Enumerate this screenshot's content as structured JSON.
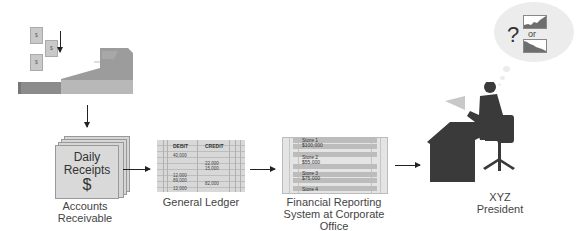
{
  "diagram": {
    "type": "flow",
    "nodes": [
      {
        "id": "cash-register",
        "label": ""
      },
      {
        "id": "accounts-receivable",
        "label_lines": [
          "Accounts",
          "Receivable"
        ]
      },
      {
        "id": "general-ledger",
        "label": "General Ledger"
      },
      {
        "id": "financial-reporting",
        "label_lines": [
          "Financial Reporting",
          "System at Corporate",
          "Office"
        ]
      },
      {
        "id": "president",
        "label_lines": [
          "XYZ",
          "President"
        ]
      }
    ],
    "edges": [
      [
        "cash-register",
        "accounts-receivable"
      ],
      [
        "accounts-receivable",
        "general-ledger"
      ],
      [
        "general-ledger",
        "financial-reporting"
      ],
      [
        "financial-reporting",
        "president"
      ]
    ]
  },
  "bills": [
    "$",
    "$",
    "$"
  ],
  "receipts": {
    "line1": "Daily",
    "line2": "Receipts",
    "symbol": "$"
  },
  "labels": {
    "accounts_receivable": [
      "Accounts",
      "Receivable"
    ],
    "general_ledger": "General Ledger",
    "financial_reporting": [
      "Financial Reporting",
      "System at Corporate",
      "Office"
    ],
    "president": [
      "XYZ",
      "President"
    ]
  },
  "ledger": {
    "headers": [
      "DEBIT",
      "CREDIT"
    ],
    "debit_values": [
      "40,000",
      "12,000",
      "89,000",
      "12,000"
    ],
    "credit_values": [
      "22,000",
      "15,000",
      "82,000"
    ]
  },
  "report": {
    "stores": [
      {
        "name": "Store 1",
        "amount": "$100,000"
      },
      {
        "name": "Store 2",
        "amount": "$55,000"
      },
      {
        "name": "Store 3",
        "amount": "$75,000"
      },
      {
        "name": "Store 4",
        "amount": ""
      }
    ]
  },
  "thought": {
    "question": "?",
    "or": "or"
  },
  "colors": {
    "gray_dark": "#3a3a3a",
    "gray_mid": "#9a9a9a",
    "gray_light": "#d6d6d6",
    "arrow": "#222222"
  }
}
